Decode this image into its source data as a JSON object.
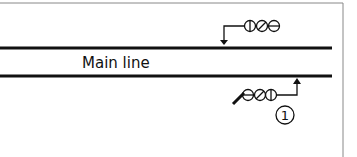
{
  "diagram": {
    "track_label": "Main line",
    "callout_number": "1",
    "colors": {
      "line": "#111111",
      "frame": "#888888",
      "background": "#ffffff"
    },
    "tracks": [
      {
        "name": "upper-track",
        "y": 48
      },
      {
        "name": "lower-track",
        "y": 76
      }
    ],
    "signals": [
      {
        "name": "upper-signal",
        "side": "above-track",
        "lamps": [
          "vertical-bar",
          "diagonal-bar",
          "horizontal-bar"
        ],
        "arrow": "down"
      },
      {
        "name": "lower-signal",
        "side": "below-track",
        "lamps": [
          "horizontal-bar",
          "diagonal-bar",
          "vertical-bar"
        ],
        "arrow": "up"
      }
    ]
  }
}
